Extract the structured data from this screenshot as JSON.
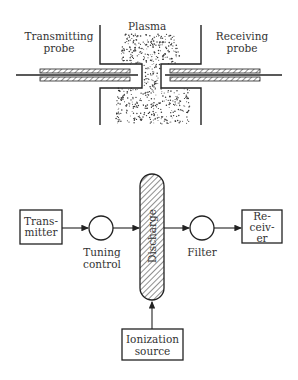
{
  "top_diagram": {
    "plasma_label": "Plasma",
    "transmitting_probe_label": [
      "Transmitting",
      "probe"
    ],
    "receiving_probe_label": [
      "Receiving",
      "probe"
    ]
  },
  "block_diagram": {
    "transmitter": [
      "Trans-",
      "mitter"
    ],
    "tuning_control": [
      "Tuning",
      "control"
    ],
    "discharge": "Discharge",
    "filter": "Filter",
    "receiver": [
      "Re-",
      "ceiv-",
      "er"
    ],
    "ionization_source": [
      "Ionization",
      "source"
    ]
  },
  "colors": {
    "line": "#222222",
    "background": "#ffffff"
  }
}
